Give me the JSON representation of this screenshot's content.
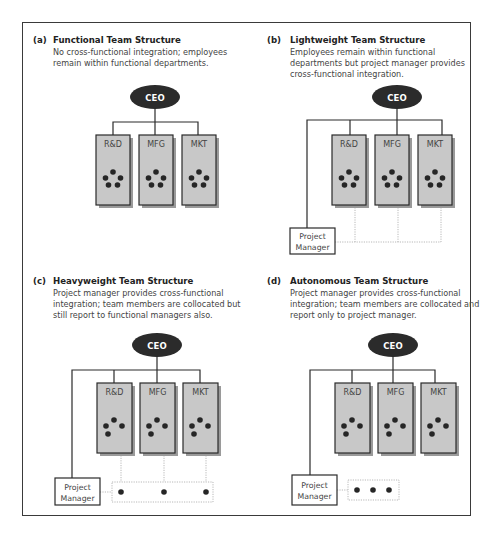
{
  "figure": {
    "colors": {
      "frame": "#3a3a3a",
      "ceo_fill": "#2b2b2b",
      "ceo_text": "#ffffff",
      "dept_fill": "#c8c8c8",
      "dept_border": "#2a2a2a",
      "dept_shadow": "#9a9a9a",
      "member_dot": "#262626",
      "connector": "#2a2a2a",
      "dotted_link": "#b8b8b8",
      "pm_fill": "#ffffff",
      "pm_border": "#2a2a2a"
    },
    "panels": [
      {
        "id": "a",
        "label": "(a)",
        "title": "Functional Team Structure",
        "description_lines": [
          "No cross-functional integration; employees",
          "remain within functional departments."
        ],
        "ceo": "CEO",
        "departments": [
          "R&D",
          "MFG",
          "MKT"
        ],
        "members_per_department": 5,
        "project_manager": null
      },
      {
        "id": "b",
        "label": "(b)",
        "title": "Lightweight Team Structure",
        "description_lines": [
          "Employees remain within functional",
          "departments but project manager provides",
          "cross-functional integration."
        ],
        "ceo": "CEO",
        "departments": [
          "R&D",
          "MFG",
          "MKT"
        ],
        "members_per_department": 5,
        "project_manager": [
          "Project",
          "Manager"
        ]
      },
      {
        "id": "c",
        "label": "(c)",
        "title": "Heavyweight Team Structure",
        "description_lines": [
          "Project manager provides cross-functional",
          "integration; team members are collocated but",
          "still report to functional managers also."
        ],
        "ceo": "CEO",
        "departments": [
          "R&D",
          "MFG",
          "MKT"
        ],
        "members_per_department": 4,
        "project_manager": [
          "Project",
          "Manager"
        ],
        "collocated_team_members": 3
      },
      {
        "id": "d",
        "label": "(d)",
        "title": "Autonomous Team Structure",
        "description_lines": [
          "Project manager provides cross-functional",
          "integration; team members are collocated and",
          "report only to project manager."
        ],
        "ceo": "CEO",
        "departments": [
          "R&D",
          "MFG",
          "MKT"
        ],
        "members_per_department": 4,
        "project_manager": [
          "Project",
          "Manager"
        ],
        "collocated_team_members": 3
      }
    ]
  }
}
